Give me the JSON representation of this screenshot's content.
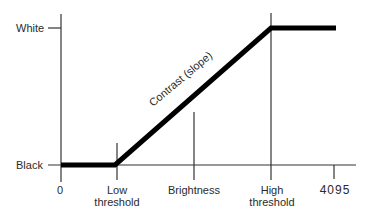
{
  "diagram": {
    "y_axis": {
      "labels": {
        "top": "White",
        "bottom": "Black"
      }
    },
    "x_axis": {
      "ticks": [
        {
          "label": "0"
        },
        {
          "label_line1": "Low",
          "label_line2": "threshold"
        },
        {
          "label": "Brightness"
        },
        {
          "label_line1": "High",
          "label_line2": "threshold"
        },
        {
          "label": "4095"
        }
      ]
    },
    "curve": {
      "annotation": "Contrast (slope)",
      "color": "#000000"
    }
  }
}
